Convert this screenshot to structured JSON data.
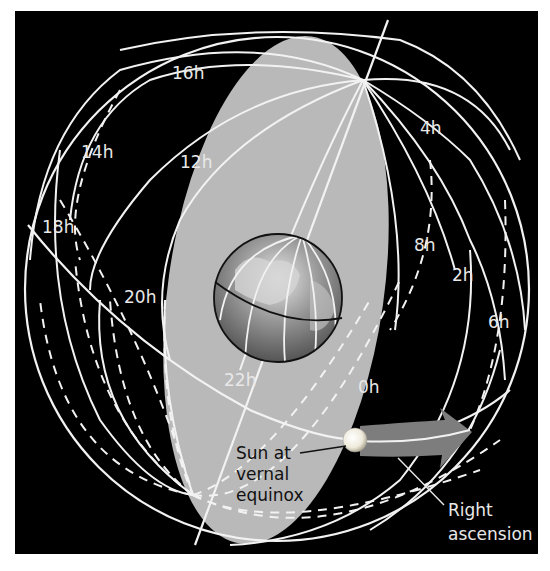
{
  "diagram": {
    "colors": {
      "background": "#000000",
      "page": "#ffffff",
      "ecliptic_plane": "#b9b9b9",
      "lines": "#f2f2f2",
      "arrow": "#7d7d7d",
      "sun": "#f4f2e6",
      "dark_text": "#111111",
      "light_text": "#e8e8e8"
    },
    "hour_labels": [
      {
        "id": "h0",
        "text": "0h"
      },
      {
        "id": "h2",
        "text": "2h"
      },
      {
        "id": "h4",
        "text": "4h"
      },
      {
        "id": "h6",
        "text": "6h"
      },
      {
        "id": "h8",
        "text": "8h"
      },
      {
        "id": "h12",
        "text": "12h"
      },
      {
        "id": "h14",
        "text": "14h"
      },
      {
        "id": "h16",
        "text": "16h"
      },
      {
        "id": "h18",
        "text": "18h"
      },
      {
        "id": "h20",
        "text": "20h"
      },
      {
        "id": "h22",
        "text": "22h"
      }
    ],
    "callouts": {
      "sun": [
        "Sun at",
        "vernal",
        "equinox"
      ],
      "right_ascension": [
        "Right",
        "ascension"
      ]
    }
  }
}
